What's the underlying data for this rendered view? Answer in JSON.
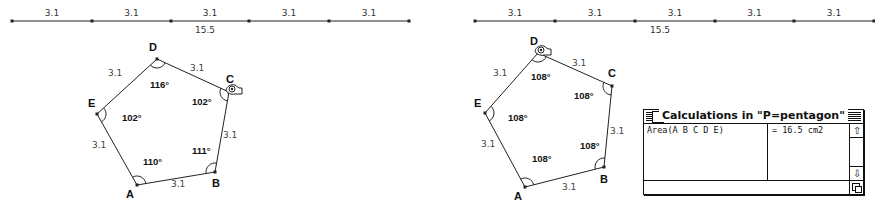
{
  "left": {
    "segment_line": {
      "y": 21,
      "points_x": [
        12,
        92,
        171,
        249,
        329,
        409
      ],
      "segment_labels": [
        "3.1",
        "3.1",
        "3.1",
        "3.1",
        "3.1"
      ],
      "total_label": "15.5",
      "total_label_pos": [
        205,
        33
      ]
    },
    "pentagon": {
      "vertices": {
        "A": [
          137,
          185
        ],
        "B": [
          215,
          172
        ],
        "C": [
          229,
          92
        ],
        "D": [
          157,
          59
        ],
        "E": [
          97,
          114
        ]
      },
      "vertex_labels": [
        {
          "name": "A",
          "pos": [
            126,
            198
          ]
        },
        {
          "name": "B",
          "pos": [
            212,
            187
          ]
        },
        {
          "name": "C",
          "pos": [
            226,
            83
          ]
        },
        {
          "name": "D",
          "pos": [
            149,
            51
          ]
        },
        {
          "name": "E",
          "pos": [
            88,
            107
          ]
        }
      ],
      "angle_labels": [
        {
          "vertex": "A",
          "text": "110°",
          "pos": [
            143,
            165
          ]
        },
        {
          "vertex": "B",
          "text": "111°",
          "pos": [
            192,
            154
          ]
        },
        {
          "vertex": "C",
          "text": "102°",
          "pos": [
            192,
            105
          ]
        },
        {
          "vertex": "D",
          "text": "116°",
          "pos": [
            150,
            88
          ]
        },
        {
          "vertex": "E",
          "text": "102°",
          "pos": [
            122,
            121
          ]
        }
      ],
      "side_labels": [
        {
          "text": "3.1",
          "pos": [
            171,
            187
          ]
        },
        {
          "text": "3.1",
          "pos": [
            223,
            138
          ]
        },
        {
          "text": "3.1",
          "pos": [
            190,
            71
          ]
        },
        {
          "text": "3.1",
          "pos": [
            108,
            76
          ]
        },
        {
          "text": "3.1",
          "pos": [
            92,
            148
          ]
        }
      ],
      "cursor_at": "C"
    }
  },
  "right": {
    "segment_line": {
      "y": 21,
      "points_x": [
        475,
        555,
        635,
        715,
        794,
        874
      ],
      "segment_labels": [
        "3.1",
        "3.1",
        "3.1",
        "3.1",
        "3.1"
      ],
      "total_label": "15.5",
      "total_label_pos": [
        660,
        33
      ]
    },
    "pentagon": {
      "vertices": {
        "A": [
          525,
          187
        ],
        "B": [
          604,
          167
        ],
        "C": [
          612,
          86
        ],
        "D": [
          538,
          53
        ],
        "E": [
          485,
          113
        ]
      },
      "vertex_labels": [
        {
          "name": "A",
          "pos": [
            514,
            200
          ]
        },
        {
          "name": "B",
          "pos": [
            600,
            183
          ]
        },
        {
          "name": "C",
          "pos": [
            608,
            77
          ]
        },
        {
          "name": "D",
          "pos": [
            530,
            45
          ]
        },
        {
          "name": "E",
          "pos": [
            474,
            107
          ]
        }
      ],
      "angle_labels": [
        {
          "vertex": "A",
          "text": "108°",
          "pos": [
            532,
            162
          ]
        },
        {
          "vertex": "B",
          "text": "108°",
          "pos": [
            580,
            149
          ]
        },
        {
          "vertex": "C",
          "text": "108°",
          "pos": [
            574,
            99
          ]
        },
        {
          "vertex": "D",
          "text": "108°",
          "pos": [
            531,
            80
          ]
        },
        {
          "vertex": "E",
          "text": "108°",
          "pos": [
            508,
            121
          ]
        }
      ],
      "side_labels": [
        {
          "text": "3.1",
          "pos": [
            562,
            190
          ]
        },
        {
          "text": "3.1",
          "pos": [
            610,
            134
          ]
        },
        {
          "text": "3.1",
          "pos": [
            572,
            66
          ]
        },
        {
          "text": "3.1",
          "pos": [
            493,
            76
          ]
        },
        {
          "text": "3.1",
          "pos": [
            481,
            147
          ]
        }
      ],
      "cursor_at": "D"
    }
  },
  "calc_window": {
    "title": "Calculations in \"P=pentagon\"",
    "rows": [
      {
        "expression": "Area(A B C D E)",
        "value": "= 16.5 cm2"
      }
    ],
    "scroll_up_icon": "⇧",
    "scroll_down_icon": "⇩"
  },
  "colors": {
    "line": "#222222",
    "background": "#ffffff"
  }
}
